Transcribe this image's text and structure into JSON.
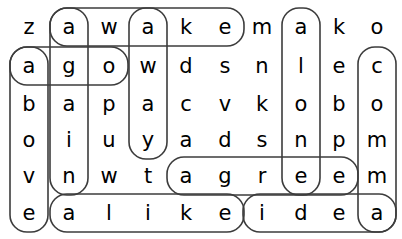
{
  "puzzle": {
    "type": "word-search",
    "rows": 6,
    "cols": 10,
    "grid": [
      [
        "z",
        "a",
        "w",
        "a",
        "k",
        "e",
        "m",
        "a",
        "k",
        "o"
      ],
      [
        "a",
        "g",
        "o",
        "w",
        "d",
        "s",
        "n",
        "l",
        "e",
        "c"
      ],
      [
        "b",
        "a",
        "p",
        "a",
        "c",
        "v",
        "k",
        "o",
        "b",
        "o"
      ],
      [
        "o",
        "i",
        "u",
        "y",
        "a",
        "d",
        "s",
        "n",
        "p",
        "m"
      ],
      [
        "v",
        "n",
        "w",
        "t",
        "a",
        "g",
        "r",
        "e",
        "e",
        "m"
      ],
      [
        "e",
        "a",
        "l",
        "i",
        "k",
        "e",
        "i",
        "d",
        "e",
        "a"
      ]
    ],
    "found_words": [
      {
        "word": "awake",
        "direction": "horizontal",
        "row": 0,
        "col_start": 1,
        "col_end": 5
      },
      {
        "word": "ago",
        "direction": "horizontal",
        "row": 1,
        "col_start": 0,
        "col_end": 2
      },
      {
        "word": "agree",
        "direction": "horizontal",
        "row": 4,
        "col_start": 4,
        "col_end": 8
      },
      {
        "word": "alike",
        "direction": "horizontal",
        "row": 5,
        "col_start": 1,
        "col_end": 5
      },
      {
        "word": "idea",
        "direction": "horizontal",
        "row": 5,
        "col_start": 6,
        "col_end": 9
      },
      {
        "word": "again",
        "direction": "vertical",
        "col": 1,
        "row_start": 0,
        "row_end": 4
      },
      {
        "word": "above",
        "direction": "vertical",
        "col": 0,
        "row_start": 1,
        "row_end": 5
      },
      {
        "word": "away",
        "direction": "vertical",
        "col": 3,
        "row_start": 0,
        "row_end": 3
      },
      {
        "word": "alone",
        "direction": "vertical",
        "col": 7,
        "row_start": 0,
        "row_end": 4
      },
      {
        "word": "comma",
        "direction": "vertical",
        "col": 9,
        "row_start": 1,
        "row_end": 5
      }
    ],
    "colors": {
      "letter": "#000000",
      "highlight_stroke": "#3c3c3c",
      "background": "#ffffff"
    },
    "geometry": {
      "col_centers": [
        29,
        69,
        109,
        148,
        186,
        225,
        262,
        301,
        339,
        377
      ],
      "row_centers": [
        27,
        66,
        104,
        140,
        176,
        213
      ],
      "cell_half": 17,
      "oval_half_w": 19,
      "oval_half_h": 19,
      "corner_radius": 17
    }
  }
}
